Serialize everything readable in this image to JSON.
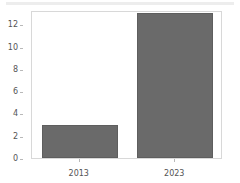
{
  "chart_data": {
    "type": "bar",
    "title": "",
    "subtitle": "",
    "xlabel": "",
    "ylabel": "",
    "categories": [
      "2013",
      "2023"
    ],
    "values": [
      3,
      13
    ],
    "series": [
      {
        "name": "",
        "values": [
          3,
          13
        ]
      }
    ],
    "ylim": [
      0,
      13.3
    ],
    "yticks": [
      0,
      2,
      4,
      6,
      8,
      10,
      12
    ],
    "ytick_labels": [
      "0",
      "2",
      "4",
      "6",
      "8",
      "10",
      "12"
    ],
    "xtick_labels": [
      "2013",
      "2023"
    ],
    "grid": false,
    "legend": false,
    "legend_position": "none",
    "annotations": [],
    "colors": {
      "bar_fill": "#6a6a6a",
      "bar_edge": "#5e5e5e",
      "plot_border": "#d8d8d8",
      "tick_color": "#b9b9b9",
      "text": "#545454",
      "background": "#ffffff",
      "top_band": "#ededed"
    }
  }
}
